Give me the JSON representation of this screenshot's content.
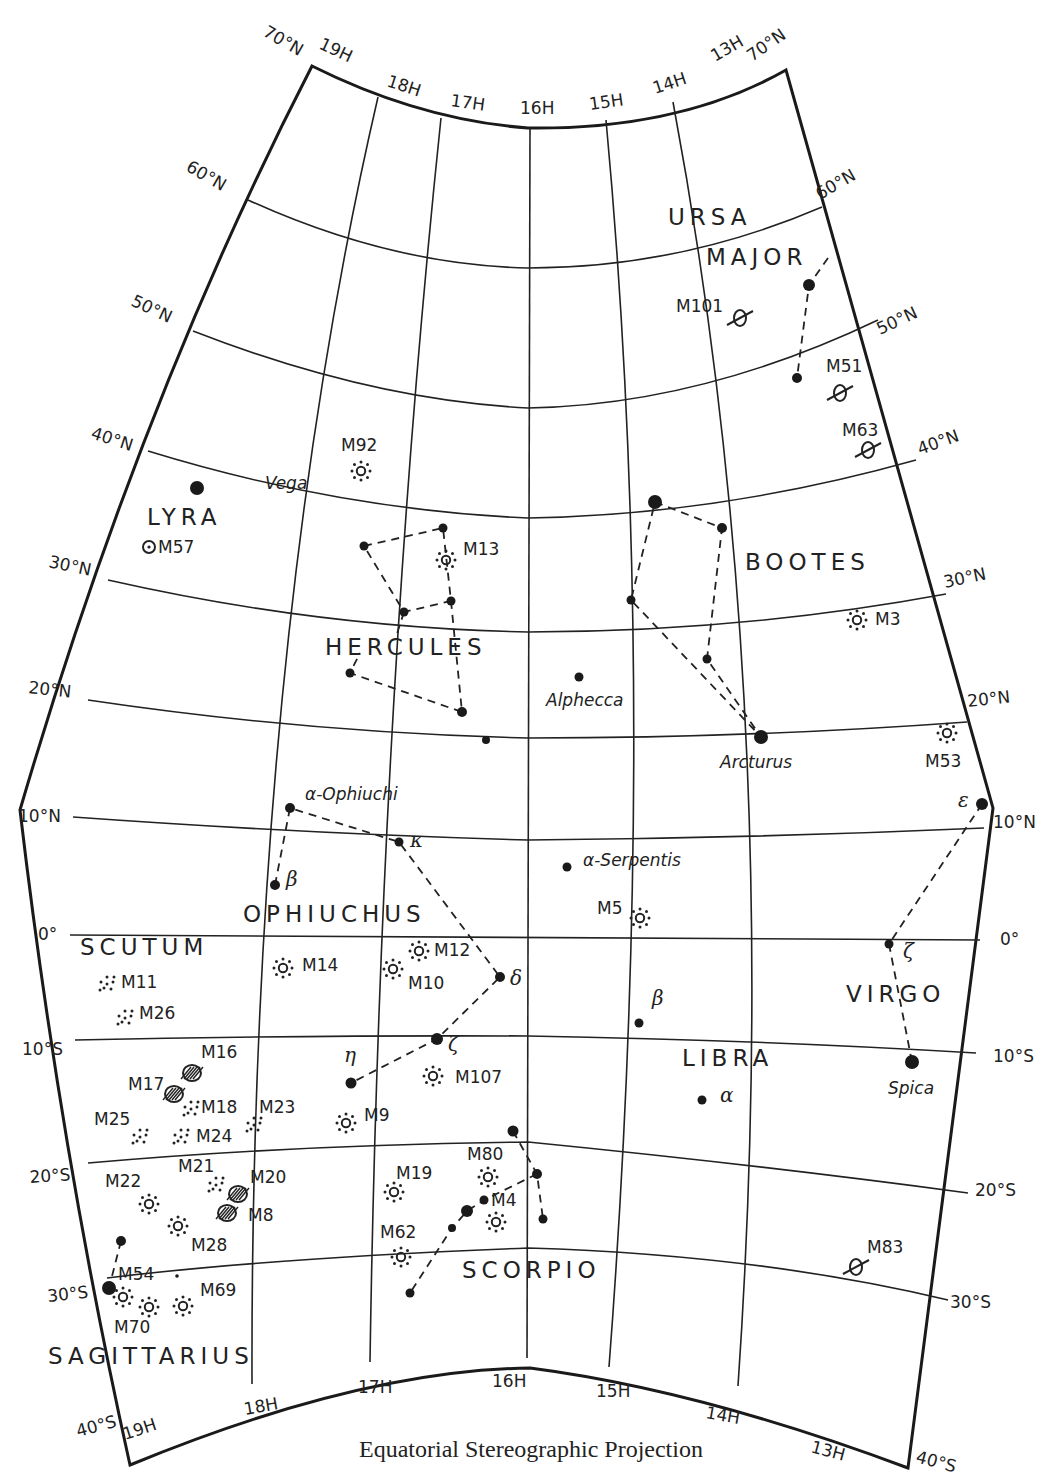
{
  "caption": "Equatorial Stereographic Projection",
  "ra_labels": {
    "top": [
      "19H",
      "18H",
      "17H",
      "16H",
      "15H",
      "14H",
      "13H"
    ],
    "bottom": [
      "19H",
      "18H",
      "17H",
      "16H",
      "15H",
      "14H",
      "13H"
    ]
  },
  "dec_labels": {
    "left": [
      "70°N",
      "60°N",
      "50°N",
      "40°N",
      "30°N",
      "20°N",
      "10°N",
      "0°",
      "10°S",
      "20°S",
      "30°S",
      "40°S"
    ],
    "right": [
      "70°N",
      "60°N",
      "50°N",
      "40°N",
      "30°N",
      "20°N",
      "10°N",
      "0°",
      "10°S",
      "20°S",
      "30°S",
      "40°S"
    ]
  },
  "constellations": [
    {
      "name": "URSA",
      "x": 668,
      "y": 225
    },
    {
      "name": "MAJOR",
      "x": 706,
      "y": 265
    },
    {
      "name": "LYRA",
      "x": 147,
      "y": 525
    },
    {
      "name": "BOOTES",
      "x": 745,
      "y": 570
    },
    {
      "name": "HERCULES",
      "x": 325,
      "y": 655
    },
    {
      "name": "OPHIUCHUS",
      "x": 243,
      "y": 922
    },
    {
      "name": "SCUTUM",
      "x": 80,
      "y": 955
    },
    {
      "name": "VIRGO",
      "x": 846,
      "y": 1002
    },
    {
      "name": "LIBRA",
      "x": 682,
      "y": 1066
    },
    {
      "name": "SCORPIO",
      "x": 462,
      "y": 1278
    },
    {
      "name": "SAGITTARIUS",
      "x": 48,
      "y": 1364
    }
  ],
  "named_stars": [
    {
      "name": "Vega",
      "x": 265,
      "y": 489
    },
    {
      "name": "Alphecca",
      "x": 546,
      "y": 706
    },
    {
      "name": "Arcturus",
      "x": 720,
      "y": 768
    },
    {
      "name": "α-Ophiuchi",
      "x": 305,
      "y": 800
    },
    {
      "name": "α-Serpentis",
      "x": 583,
      "y": 866
    },
    {
      "name": "Spica",
      "x": 888,
      "y": 1094
    }
  ],
  "greek_labels": [
    {
      "text": "β",
      "x": 286,
      "y": 886
    },
    {
      "text": "κ",
      "x": 410,
      "y": 847
    },
    {
      "text": "δ",
      "x": 510,
      "y": 985
    },
    {
      "text": "ζ",
      "x": 448,
      "y": 1051
    },
    {
      "text": "η",
      "x": 344,
      "y": 1062
    },
    {
      "text": "β",
      "x": 652,
      "y": 1005
    },
    {
      "text": "α",
      "x": 720,
      "y": 1102
    },
    {
      "text": "ζ",
      "x": 903,
      "y": 958
    },
    {
      "text": "ε",
      "x": 958,
      "y": 807
    }
  ],
  "messier_objects": [
    {
      "id": "M101",
      "type": "galaxy",
      "x": 740,
      "y": 318,
      "lx": 676,
      "ly": 312
    },
    {
      "id": "M51",
      "type": "galaxy",
      "x": 840,
      "y": 393,
      "lx": 826,
      "ly": 372
    },
    {
      "id": "M63",
      "type": "galaxy",
      "x": 868,
      "y": 450,
      "lx": 842,
      "ly": 436
    },
    {
      "id": "M83",
      "type": "galaxy",
      "x": 856,
      "y": 1267,
      "lx": 867,
      "ly": 1253
    },
    {
      "id": "M57",
      "type": "planetary",
      "x": 149,
      "y": 547,
      "lx": 158,
      "ly": 553
    },
    {
      "id": "M92",
      "type": "globular",
      "x": 361,
      "y": 471,
      "lx": 341,
      "ly": 451
    },
    {
      "id": "M13",
      "type": "globular",
      "x": 446,
      "y": 560,
      "lx": 463,
      "ly": 555
    },
    {
      "id": "M3",
      "type": "globular",
      "x": 857,
      "y": 620,
      "lx": 875,
      "ly": 625
    },
    {
      "id": "M53",
      "type": "globular",
      "x": 947,
      "y": 733,
      "lx": 925,
      "ly": 767
    },
    {
      "id": "M5",
      "type": "globular",
      "x": 640,
      "y": 918,
      "lx": 597,
      "ly": 914
    },
    {
      "id": "M14",
      "type": "globular",
      "x": 283,
      "y": 968,
      "lx": 302,
      "ly": 971
    },
    {
      "id": "M12",
      "type": "globular",
      "x": 419,
      "y": 951,
      "lx": 434,
      "ly": 956
    },
    {
      "id": "M10",
      "type": "globular",
      "x": 393,
      "y": 969,
      "lx": 408,
      "ly": 989
    },
    {
      "id": "M107",
      "type": "globular",
      "x": 433,
      "y": 1076,
      "lx": 455,
      "ly": 1083
    },
    {
      "id": "M9",
      "type": "globular",
      "x": 346,
      "y": 1123,
      "lx": 364,
      "ly": 1121
    },
    {
      "id": "M19",
      "type": "globular",
      "x": 394,
      "y": 1192,
      "lx": 396,
      "ly": 1179
    },
    {
      "id": "M80",
      "type": "globular",
      "x": 488,
      "y": 1177,
      "lx": 467,
      "ly": 1160
    },
    {
      "id": "M4",
      "type": "globular",
      "x": 496,
      "y": 1222,
      "lx": 491,
      "ly": 1206
    },
    {
      "id": "M62",
      "type": "globular",
      "x": 401,
      "y": 1257,
      "lx": 380,
      "ly": 1238
    },
    {
      "id": "M22",
      "type": "globular",
      "x": 149,
      "y": 1204,
      "lx": 105,
      "ly": 1187
    },
    {
      "id": "M28",
      "type": "globular",
      "x": 178,
      "y": 1226,
      "lx": 191,
      "ly": 1251
    },
    {
      "id": "M54",
      "type": "globular",
      "x": 123,
      "y": 1297,
      "lx": 118,
      "ly": 1280
    },
    {
      "id": "M70",
      "type": "globular",
      "x": 149,
      "y": 1307,
      "lx": 114,
      "ly": 1333
    },
    {
      "id": "M69",
      "type": "globular",
      "x": 183,
      "y": 1306,
      "lx": 200,
      "ly": 1296
    },
    {
      "id": "M11",
      "type": "open",
      "x": 107,
      "y": 983,
      "lx": 121,
      "ly": 988
    },
    {
      "id": "M26",
      "type": "open",
      "x": 125,
      "y": 1017,
      "lx": 139,
      "ly": 1019
    },
    {
      "id": "M18",
      "type": "open",
      "x": 191,
      "y": 1108,
      "lx": 201,
      "ly": 1113
    },
    {
      "id": "M24",
      "type": "open",
      "x": 181,
      "y": 1136,
      "lx": 196,
      "ly": 1142
    },
    {
      "id": "M25",
      "type": "open",
      "x": 140,
      "y": 1136,
      "lx": 94,
      "ly": 1125
    },
    {
      "id": "M23",
      "type": "open",
      "x": 254,
      "y": 1124,
      "lx": 259,
      "ly": 1113
    },
    {
      "id": "M21",
      "type": "open",
      "x": 216,
      "y": 1184,
      "lx": 178,
      "ly": 1172
    },
    {
      "id": "M16",
      "type": "nebula",
      "x": 192,
      "y": 1073,
      "lx": 201,
      "ly": 1058
    },
    {
      "id": "M17",
      "type": "nebula",
      "x": 174,
      "y": 1094,
      "lx": 128,
      "ly": 1090
    },
    {
      "id": "M20",
      "type": "nebula",
      "x": 238,
      "y": 1194,
      "lx": 250,
      "ly": 1183
    },
    {
      "id": "M8",
      "type": "nebula",
      "x": 227,
      "y": 1213,
      "lx": 248,
      "ly": 1221
    }
  ],
  "stars": [
    {
      "x": 809,
      "y": 285,
      "r": 6
    },
    {
      "x": 797,
      "y": 378,
      "r": 5
    },
    {
      "x": 197,
      "y": 488,
      "r": 7
    },
    {
      "x": 655,
      "y": 502,
      "r": 7
    },
    {
      "x": 722,
      "y": 528,
      "r": 5
    },
    {
      "x": 631,
      "y": 600,
      "r": 4.5
    },
    {
      "x": 707,
      "y": 659,
      "r": 4.5
    },
    {
      "x": 761,
      "y": 737,
      "r": 7
    },
    {
      "x": 579,
      "y": 677,
      "r": 4.5
    },
    {
      "x": 364,
      "y": 546,
      "r": 4.5
    },
    {
      "x": 443,
      "y": 528,
      "r": 4.5
    },
    {
      "x": 451,
      "y": 601,
      "r": 4.5
    },
    {
      "x": 404,
      "y": 612,
      "r": 4.5
    },
    {
      "x": 350,
      "y": 673,
      "r": 4.5
    },
    {
      "x": 462,
      "y": 712,
      "r": 5
    },
    {
      "x": 486,
      "y": 740,
      "r": 4
    },
    {
      "x": 290,
      "y": 808,
      "r": 5
    },
    {
      "x": 275,
      "y": 885,
      "r": 5
    },
    {
      "x": 399,
      "y": 842,
      "r": 4.5
    },
    {
      "x": 500,
      "y": 977,
      "r": 5
    },
    {
      "x": 437,
      "y": 1039,
      "r": 6
    },
    {
      "x": 351,
      "y": 1083,
      "r": 5.5
    },
    {
      "x": 567,
      "y": 867,
      "r": 4.5
    },
    {
      "x": 639,
      "y": 1023,
      "r": 4.5
    },
    {
      "x": 702,
      "y": 1100,
      "r": 4.5
    },
    {
      "x": 982,
      "y": 804,
      "r": 6
    },
    {
      "x": 889,
      "y": 944,
      "r": 4.5
    },
    {
      "x": 912,
      "y": 1062,
      "r": 7
    },
    {
      "x": 513,
      "y": 1131,
      "r": 5.5
    },
    {
      "x": 537,
      "y": 1174,
      "r": 5
    },
    {
      "x": 543,
      "y": 1219,
      "r": 4.5
    },
    {
      "x": 484,
      "y": 1200,
      "r": 4.5
    },
    {
      "x": 467,
      "y": 1211,
      "r": 6
    },
    {
      "x": 452,
      "y": 1228,
      "r": 4
    },
    {
      "x": 410,
      "y": 1293,
      "r": 4.5
    },
    {
      "x": 121,
      "y": 1241,
      "r": 5
    },
    {
      "x": 109,
      "y": 1288,
      "r": 7
    },
    {
      "x": 177,
      "y": 1276,
      "r": 1.8
    }
  ],
  "stick_figures": [
    {
      "name": "ursa-major",
      "points": [
        [
          828,
          258
        ],
        [
          809,
          285
        ],
        [
          797,
          378
        ]
      ]
    },
    {
      "name": "bootes",
      "points": [
        [
          655,
          502
        ],
        [
          722,
          528
        ],
        [
          707,
          659
        ],
        [
          761,
          737
        ],
        [
          631,
          600
        ],
        [
          655,
          502
        ]
      ]
    },
    {
      "name": "hercules-a",
      "points": [
        [
          364,
          546
        ],
        [
          443,
          528
        ],
        [
          451,
          601
        ],
        [
          404,
          612
        ],
        [
          364,
          546
        ]
      ]
    },
    {
      "name": "hercules-b",
      "points": [
        [
          451,
          601
        ],
        [
          462,
          712
        ],
        [
          350,
          673
        ],
        [
          360,
          653
        ]
      ]
    },
    {
      "name": "hercules-c",
      "points": [
        [
          404,
          612
        ],
        [
          395,
          640
        ]
      ]
    },
    {
      "name": "ophiuchus",
      "points": [
        [
          275,
          885
        ],
        [
          290,
          808
        ],
        [
          399,
          842
        ],
        [
          500,
          977
        ],
        [
          437,
          1039
        ],
        [
          351,
          1083
        ]
      ]
    },
    {
      "name": "virgo",
      "points": [
        [
          982,
          804
        ],
        [
          889,
          944
        ],
        [
          912,
          1062
        ]
      ]
    },
    {
      "name": "scorpio",
      "points": [
        [
          513,
          1131
        ],
        [
          537,
          1174
        ],
        [
          543,
          1219
        ]
      ]
    },
    {
      "name": "scorpio-tail",
      "points": [
        [
          537,
          1174
        ],
        [
          484,
          1200
        ],
        [
          467,
          1211
        ],
        [
          452,
          1228
        ],
        [
          410,
          1293
        ]
      ]
    },
    {
      "name": "sagittarius",
      "points": [
        [
          121,
          1241
        ],
        [
          109,
          1288
        ]
      ]
    }
  ]
}
